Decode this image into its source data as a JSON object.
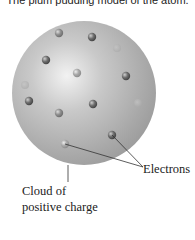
{
  "title": "The plum pudding model of the atom.",
  "diagram": {
    "sphere": {
      "cx": 84,
      "cy": 93,
      "r": 72,
      "color": "#b3b3b3",
      "highlight": "#eeeeee",
      "shade": "#8c8c8c"
    },
    "electrons": [
      {
        "x": 59,
        "y": 33,
        "tone": "medium"
      },
      {
        "x": 92,
        "y": 37,
        "tone": "dark"
      },
      {
        "x": 117,
        "y": 48,
        "tone": "faint"
      },
      {
        "x": 46,
        "y": 60,
        "tone": "dark"
      },
      {
        "x": 77,
        "y": 73,
        "tone": "light"
      },
      {
        "x": 126,
        "y": 76,
        "tone": "dark"
      },
      {
        "x": 25,
        "y": 85,
        "tone": "faint"
      },
      {
        "x": 29,
        "y": 101,
        "tone": "dark"
      },
      {
        "x": 93,
        "y": 104,
        "tone": "dark"
      },
      {
        "x": 138,
        "y": 103,
        "tone": "faint"
      },
      {
        "x": 59,
        "y": 113,
        "tone": "medium"
      },
      {
        "x": 112,
        "y": 135,
        "tone": "dark"
      },
      {
        "x": 65,
        "y": 144,
        "tone": "light"
      }
    ],
    "labels": {
      "electrons": "Electrons",
      "cloud_line1": "Cloud of",
      "cloud_line2": "positive charge"
    }
  }
}
